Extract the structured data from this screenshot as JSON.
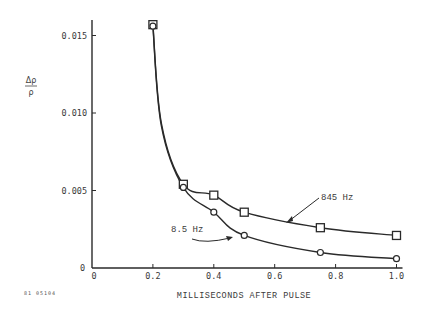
{
  "chart_data": {
    "type": "line",
    "title": "",
    "xlabel": "MILLISECONDS AFTER PULSE",
    "ylabel_numerator": "Δρ",
    "ylabel_denominator": "ρ",
    "xlim": [
      0,
      1.0
    ],
    "ylim": [
      0,
      0.016
    ],
    "xticks": [
      0,
      0.2,
      0.4,
      0.6,
      0.8,
      1.0
    ],
    "xtick_labels": [
      "0",
      "0.2",
      "0.4",
      "0.6",
      "0.8",
      "1.0"
    ],
    "yticks": [
      0,
      0.005,
      0.01,
      0.015
    ],
    "ytick_labels": [
      "0",
      "0.005",
      "0.010",
      "0.015"
    ],
    "grid": false,
    "series": [
      {
        "name": "845 Hz",
        "marker": "square",
        "x": [
          0.2,
          0.3,
          0.4,
          0.5,
          0.75,
          1.0
        ],
        "y": [
          0.0157,
          0.0054,
          0.0047,
          0.0036,
          0.0026,
          0.0021
        ]
      },
      {
        "name": "8.5 Hz",
        "marker": "circle",
        "x": [
          0.2,
          0.3,
          0.4,
          0.5,
          0.75,
          1.0
        ],
        "y": [
          0.0156,
          0.0052,
          0.0036,
          0.0021,
          0.001,
          0.0006
        ]
      }
    ],
    "annotations": [
      {
        "text": "845 Hz",
        "series": "845 Hz"
      },
      {
        "text": "8.5 Hz",
        "series": "8.5 Hz"
      }
    ],
    "figure_id": "81 05104",
    "line_color": "#2a2a2a"
  }
}
